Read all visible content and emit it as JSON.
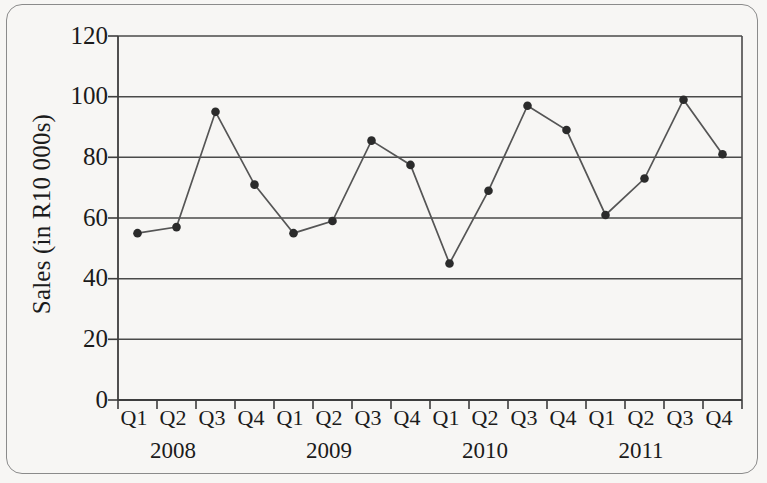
{
  "chart_data": {
    "type": "line",
    "title": "",
    "subtitle": "",
    "xlabel": "",
    "ylabel": "Sales (in R10 000s)",
    "ylim": [
      0,
      120
    ],
    "y_ticks": [
      0,
      20,
      40,
      60,
      80,
      100,
      120
    ],
    "grid": "horizontal",
    "legend": "none",
    "marker": "filled-circle",
    "line_color": "#555555",
    "marker_color": "#2b2b2b",
    "grid_color": "#4a4a4a",
    "axis_color": "#3d3d3d",
    "background_color": "#f7f6f4",
    "categories": [
      "Q1",
      "Q2",
      "Q3",
      "Q4",
      "Q1",
      "Q2",
      "Q3",
      "Q4",
      "Q1",
      "Q2",
      "Q3",
      "Q4",
      "Q1",
      "Q2",
      "Q3",
      "Q4"
    ],
    "group_labels": [
      "2008",
      "2009",
      "2010",
      "2011"
    ],
    "values": [
      55,
      57,
      95,
      71,
      55,
      59,
      85.5,
      77.5,
      45,
      69,
      97,
      89,
      61,
      73,
      99,
      81
    ],
    "series": [
      {
        "name": "Sales",
        "values": [
          55,
          57,
          95,
          71,
          55,
          59,
          85.5,
          77.5,
          45,
          69,
          97,
          89,
          61,
          73,
          99,
          81
        ]
      }
    ]
  },
  "axis": {
    "y_title": "Sales (in R10 000s)",
    "y_ticks": [
      "120",
      "100",
      "80",
      "60",
      "40",
      "20",
      "0"
    ],
    "x_ticks": [
      "Q1",
      "Q2",
      "Q3",
      "Q4",
      "Q1",
      "Q2",
      "Q3",
      "Q4",
      "Q1",
      "Q2",
      "Q3",
      "Q4",
      "Q1",
      "Q2",
      "Q3",
      "Q4"
    ],
    "years": [
      "2008",
      "2009",
      "2010",
      "2011"
    ]
  }
}
